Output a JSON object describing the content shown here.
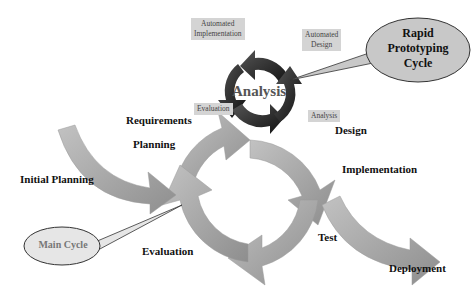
{
  "diagram": {
    "center_label": "Analysis",
    "callouts": {
      "rapid": "Rapid Prototyping Cycle",
      "rapid_lines": [
        "Rapid",
        "Prototyping",
        "Cycle"
      ],
      "main": "Main Cycle"
    },
    "rapid_cycle_boxes": {
      "automated_implementation": [
        "Automated",
        "Implementation"
      ],
      "automated_design": [
        "Automated",
        "Design"
      ],
      "evaluation": "Evaluation",
      "analysis": "Analysis"
    },
    "main_cycle_labels": {
      "requirements": "Requirements",
      "planning": "Planning",
      "initial_planning": "Initial Planning",
      "design": "Design",
      "implementation": "Implementation",
      "test": "Test",
      "evaluation": "Evaluation",
      "deployment": "Deployment"
    },
    "colors": {
      "main_arrow": "#a8a8a8",
      "rapid_arrow": "#2a2a2a",
      "label_box": "#d4d4d4",
      "bubble_fill": "#c8c8c8",
      "main_bubble_fill": "#e6e6e6"
    }
  }
}
